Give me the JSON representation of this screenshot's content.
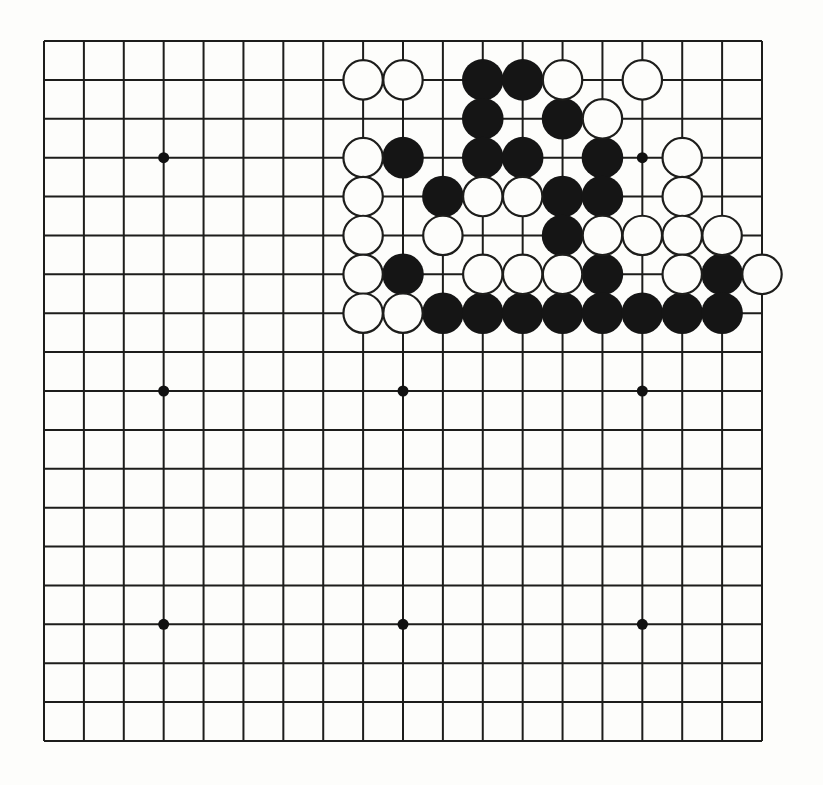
{
  "diagram": {
    "kind": "go-board-diagram",
    "board": {
      "size": 19,
      "colors": {
        "page": "#fdfdfb",
        "line": "#1d1d1b",
        "black_stone": "#151515",
        "white_stone": "#fdfdfb",
        "stone_outline": "#1d1d1b",
        "star_point": "#111111"
      },
      "star_points": [
        [
          4,
          4
        ],
        [
          16,
          4
        ],
        [
          4,
          10
        ],
        [
          10,
          10
        ],
        [
          16,
          10
        ],
        [
          4,
          16
        ],
        [
          10,
          16
        ],
        [
          16,
          16
        ]
      ],
      "black_stones": [
        [
          12,
          2
        ],
        [
          13,
          2
        ],
        [
          12,
          3
        ],
        [
          14,
          3
        ],
        [
          10,
          4
        ],
        [
          12,
          4
        ],
        [
          13,
          4
        ],
        [
          15,
          4
        ],
        [
          11,
          5
        ],
        [
          14,
          5
        ],
        [
          15,
          5
        ],
        [
          14,
          6
        ],
        [
          10,
          7
        ],
        [
          15,
          7
        ],
        [
          18,
          7
        ],
        [
          11,
          8
        ],
        [
          12,
          8
        ],
        [
          13,
          8
        ],
        [
          14,
          8
        ],
        [
          15,
          8
        ],
        [
          16,
          8
        ],
        [
          17,
          8
        ],
        [
          18,
          8
        ]
      ],
      "white_stones": [
        [
          9,
          2
        ],
        [
          10,
          2
        ],
        [
          14,
          2
        ],
        [
          16,
          2
        ],
        [
          15,
          3
        ],
        [
          9,
          4
        ],
        [
          17,
          4
        ],
        [
          9,
          5
        ],
        [
          12,
          5
        ],
        [
          13,
          5
        ],
        [
          17,
          5
        ],
        [
          9,
          6
        ],
        [
          11,
          6
        ],
        [
          15,
          6
        ],
        [
          16,
          6
        ],
        [
          17,
          6
        ],
        [
          18,
          6
        ],
        [
          9,
          7
        ],
        [
          12,
          7
        ],
        [
          13,
          7
        ],
        [
          14,
          7
        ],
        [
          17,
          7
        ],
        [
          19,
          7
        ],
        [
          9,
          8
        ],
        [
          10,
          8
        ]
      ]
    }
  }
}
